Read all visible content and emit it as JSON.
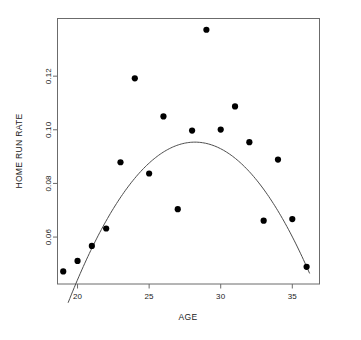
{
  "chart_data": {
    "type": "scatter",
    "title": "",
    "xlabel": "AGE",
    "ylabel": "HOME RUN RATE",
    "xlim": [
      18.6,
      36.9
    ],
    "ylim": [
      0.0425,
      0.1415
    ],
    "grid": false,
    "legend": null,
    "xticks": [
      20,
      25,
      30,
      35
    ],
    "xtick_labels": [
      "20",
      "25",
      "30",
      "35"
    ],
    "yticks": [
      0.06,
      0.08,
      0.1,
      0.12
    ],
    "ytick_labels": [
      "0.06",
      "0.08",
      "0.10",
      "0.12"
    ],
    "x": [
      19,
      20,
      21,
      22,
      23,
      24,
      25,
      26,
      27,
      28,
      29,
      30,
      31,
      32,
      33,
      34,
      35,
      36
    ],
    "y": [
      0.0472,
      0.0511,
      0.0567,
      0.0632,
      0.0879,
      0.1192,
      0.0837,
      0.105,
      0.0704,
      0.0997,
      0.1373,
      0.1001,
      0.1087,
      0.0954,
      0.0661,
      0.0889,
      0.0667,
      0.0489
    ],
    "series": [
      {
        "name": "players",
        "type": "scatter",
        "marker": "filled-circle",
        "color": "#000000",
        "points": [
          {
            "x": 19,
            "y": 0.0472
          },
          {
            "x": 20,
            "y": 0.0511
          },
          {
            "x": 21,
            "y": 0.0567
          },
          {
            "x": 22,
            "y": 0.0632
          },
          {
            "x": 23,
            "y": 0.0879
          },
          {
            "x": 24,
            "y": 0.1192
          },
          {
            "x": 25,
            "y": 0.0837
          },
          {
            "x": 26,
            "y": 0.105
          },
          {
            "x": 27,
            "y": 0.0704
          },
          {
            "x": 28,
            "y": 0.0997
          },
          {
            "x": 29,
            "y": 0.1373
          },
          {
            "x": 30,
            "y": 0.1001
          },
          {
            "x": 31,
            "y": 0.1087
          },
          {
            "x": 32,
            "y": 0.0954
          },
          {
            "x": 33,
            "y": 0.0661
          },
          {
            "x": 34,
            "y": 0.0889
          },
          {
            "x": 35,
            "y": 0.0667
          },
          {
            "x": 36,
            "y": 0.0489
          }
        ]
      },
      {
        "name": "quadratic-fit",
        "type": "line",
        "color": "#4d4d4d",
        "fit": {
          "form": "quadratic",
          "vertex_x": 28.2,
          "vertex_y": 0.0954,
          "a": -0.000763,
          "x_start": 19.35,
          "x_end": 36.2
        }
      }
    ]
  },
  "axes": {
    "x_title": "AGE",
    "y_title": "HOME RUN RATE"
  },
  "colors": {
    "point": "#000000",
    "curve": "#4d4d4d",
    "frame": "#6b6b6b",
    "text": "#1a1a1a",
    "background": "#ffffff"
  }
}
